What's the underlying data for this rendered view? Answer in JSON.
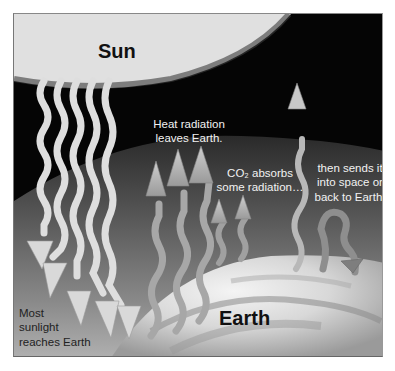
{
  "diagram": {
    "title_labels": {
      "sun": "Sun",
      "earth": "Earth"
    },
    "annotations": {
      "heat_radiation_line1": "Heat radiation",
      "heat_radiation_line2": "leaves Earth.",
      "co2_line1": "CO₂ absorbs",
      "co2_line2": "some radiation…",
      "sends_line1": "then sends it",
      "sends_line2": "into space or",
      "sends_line3": "back to Earth.",
      "sunlight_line1": "Most",
      "sunlight_line2": "sunlight",
      "sunlight_line3": "reaches Earth"
    },
    "elements": {
      "incoming_sunlight_arrows": 6,
      "outgoing_heat_arrows_long": 3,
      "outgoing_heat_arrows_short": 2,
      "escaping_arrow": 1,
      "returning_arrow": 1
    },
    "colors": {
      "sun": "#e2e2e2",
      "space": "#050505",
      "atmosphere": "#6a6a6a",
      "earth_light": "#e8e8e8",
      "arrow_light": "#dcdcdc",
      "arrow_mid": "#a8a8a8",
      "label_light": "#f2f2f2",
      "label_dark": "#111111"
    }
  }
}
